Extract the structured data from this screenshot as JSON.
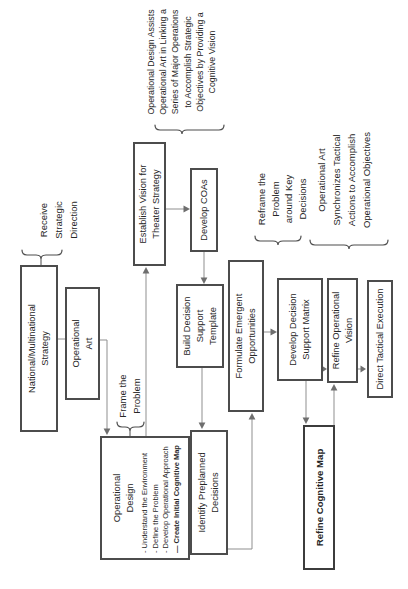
{
  "boxes": {
    "national_strategy": {
      "lines": [
        "National/Multinational",
        "Strategy"
      ]
    },
    "operational_art": {
      "lines": [
        "Operational",
        "Art"
      ]
    },
    "establish_vision": {
      "lines": [
        "Establish Vision for",
        "Theater Strategy"
      ]
    },
    "develop_coas": {
      "lines": [
        "Develop COAs"
      ]
    },
    "build_dst": {
      "lines": [
        "Build Decision",
        "Support",
        "Template"
      ]
    },
    "operational_design": {
      "title_lines": [
        "Operational",
        "Design"
      ],
      "bullets": [
        "- Understand the Environment",
        "- Define the Problem",
        "- Develop Operational Approach",
        "— Create Initial Cognitive Map"
      ]
    },
    "identify_preplanned": {
      "lines": [
        "Identify Preplanned",
        "Decisions"
      ]
    },
    "formulate_emergent": {
      "lines": [
        "Formulate Emergent",
        "Opportunities"
      ]
    },
    "develop_dsm": {
      "lines": [
        "Develop Decision",
        "Support Matrix"
      ]
    },
    "refine_vision": {
      "lines": [
        "Refine Operational",
        "Vision"
      ]
    },
    "direct_tactical": {
      "lines": [
        "Direct Tactical Execution"
      ]
    },
    "refine_cognitive_map": {
      "lines": [
        "Refine Cognitive Map"
      ]
    }
  },
  "labels": {
    "receive_direction": {
      "lines": [
        "Receive",
        "Strategic",
        "Direction"
      ]
    },
    "frame_problem": {
      "lines": [
        "Frame the",
        "Problem"
      ]
    },
    "design_assists": {
      "lines": [
        "Operational Design Assists",
        "Operational Art in Linking a",
        "Series of Major Operations",
        "to Accomplish Strategic",
        "Objectives by Providing a",
        "Cognitive Vision"
      ]
    },
    "reframe_problem": {
      "lines": [
        "Reframe the",
        "Problem",
        "around Key",
        "Decisions"
      ]
    },
    "art_synchronizes": {
      "lines": [
        "Operational Art",
        "Synchronizes Tactical",
        "Actions to Accomplish",
        "Operational Objectives"
      ]
    }
  },
  "colors": {
    "background": "#ffffff",
    "box_border": "#4c4c4c",
    "text": "#262626",
    "arrow_line": "#8f8f8f",
    "arrow_head": "#6e6e6e",
    "brace": "#4c4c4c"
  },
  "orientation_note": "flowchart rendered landscape and rotated 90 degrees counterclockwise"
}
